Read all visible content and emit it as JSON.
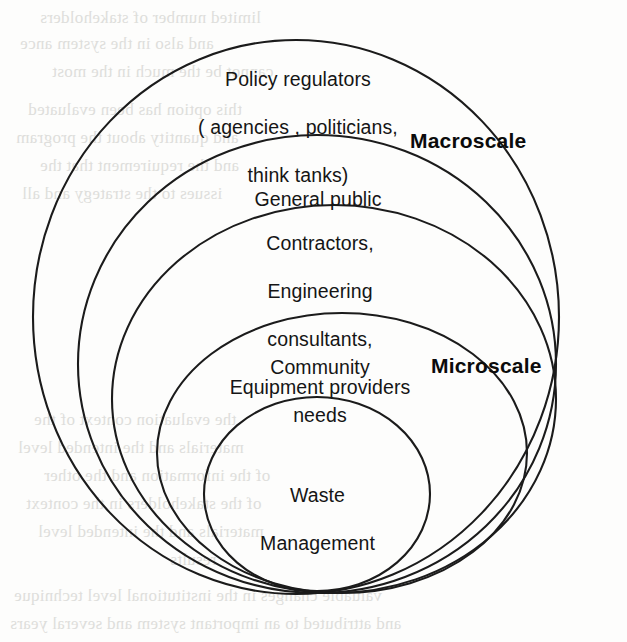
{
  "diagram": {
    "background_color": "#fdfdfc",
    "stroke_color": "#1b1b1b",
    "text_color": "#151515",
    "rings": [
      {
        "id": "policy-regulators",
        "level": 1,
        "label": "Policy regulators\n( agencies , politicians,\nthink tanks)",
        "line1": "Policy regulators",
        "line2": "( agencies , politicians,",
        "line3": "think tanks)"
      },
      {
        "id": "general-public",
        "level": 2,
        "label": "General public",
        "line1": "General public"
      },
      {
        "id": "contractors",
        "level": 3,
        "label": "Contractors,\nEngineering\nconsultants,\nEquipment providers",
        "line1": "Contractors,",
        "line2": "Engineering",
        "line3": "consultants,",
        "line4": "Equipment providers"
      },
      {
        "id": "community-needs",
        "level": 4,
        "label": "Community\nneeds",
        "line1": "Community",
        "line2": "needs"
      },
      {
        "id": "waste-management",
        "level": 5,
        "label": "Waste\nManagement",
        "line1": "Waste",
        "line2": "Management"
      }
    ],
    "annotations": {
      "macroscale": "Macroscale",
      "microscale": "Microscale"
    },
    "bleed_through": {
      "note": "faint mirrored text bleeding through from the reverse side of the scanned page",
      "lines": [
        "limited number of stakeholders",
        "and also in the system ance",
        "cannot be the much in the most",
        "this option has been evaluated",
        "and quantity about the program",
        "and the requirement that the",
        "issues to the strategy and all",
        "the evaluation context of the",
        "materials and the intended level",
        "of the information and the other",
        "of the stakeholders in the context",
        "materials and the intended level",
        "results",
        "valuable changes in the institutional level technique",
        "and attributed to an important system and several years"
      ]
    }
  }
}
